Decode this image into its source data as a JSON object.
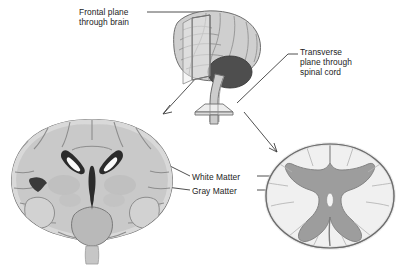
{
  "figure": {
    "background_color": "#ffffff"
  },
  "labels": {
    "frontal_plane": "Frontal plane\nthrough brain",
    "transverse_plane": "Transverse\nplane through\nspinal cord",
    "white_matter": "White Matter",
    "gray_matter": "Gray Matter"
  },
  "structures": {
    "lateral_brain": "lateral-brain-view",
    "cerebellum": "cerebellum",
    "brainstem": "brainstem",
    "spinal_cord": "spinal-cord",
    "frontal_plane_sheet": "frontal-plane-sheet",
    "transverse_plane_disc": "transverse-plane-disc",
    "coronal_section": "coronal-brain-section",
    "lateral_ventricles": "lateral-ventricles",
    "third_ventricle": "third-ventricle",
    "spinal_cord_section": "spinal-cord-cross-section",
    "spinal_gray_matter": "spinal-gray-matter-butterfly",
    "spinal_white_matter": "spinal-white-matter"
  },
  "colors": {
    "background": "#ffffff",
    "brain_fill": "#c9c9c9",
    "brain_fill_light": "#d6d6d6",
    "brain_outline": "#6e6e6e",
    "sulci": "#9b9b9b",
    "cerebellum": "#4e4e4e",
    "brainstem": "#c4c4c4",
    "plane_fill": "#e2e2e2",
    "plane_outline": "#737373",
    "ventricle_dark": "#2b2b2b",
    "ventricle_light": "#fbfbfb",
    "gray_matter": "#9d9d9d",
    "white_matter": "#f0f0f0",
    "cord_outline": "#6b6b6b",
    "leader_line": "#3c3c3c",
    "text": "#1d1d1d"
  },
  "leaders": {
    "frontal_to_plane": "horizontal-leader-right",
    "plane_to_coronal": "arrow-down-left",
    "transverse_to_disc": "diagonal-leader-down-left",
    "white_matter_to_brain": "leader-left-into-coronal",
    "white_matter_to_cord": "leader-right-into-cord",
    "gray_matter_to_brain": "leader-left-into-coronal",
    "gray_matter_to_cord": "leader-right-into-cord"
  }
}
